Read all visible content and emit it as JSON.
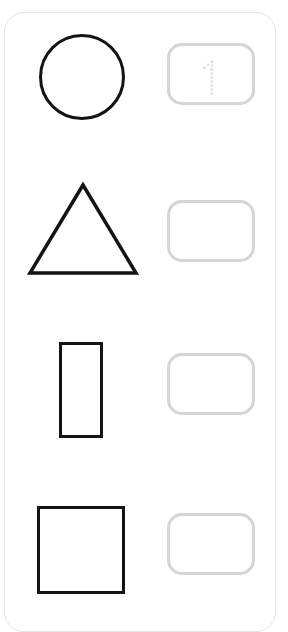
{
  "worksheet": {
    "card_name": "shape-counting-worksheet-card",
    "background_color": "#ffffff",
    "card_border_color": "#e2e2e2",
    "prompt_shape_color": "#141414",
    "answer_box_border_color": "#d5d5d5",
    "trace_hint_color": "#d9d9d9",
    "rows": [
      {
        "row_label": "row-circle",
        "shape": {
          "icon_name": "circle-outline-icon",
          "shape_type": "circle",
          "label": "Circle",
          "count": 1,
          "x": 38,
          "y": 33,
          "width": 86,
          "height": 86
        },
        "answer_box": {
          "name": "answer-box-circle",
          "x": 166,
          "y": 42,
          "width": 88,
          "height": 62,
          "value": "",
          "placeholder": "",
          "trace_hint": {
            "icon_name": "dotted-numeral-one-icon",
            "glyph": "1",
            "visible": true
          }
        }
      },
      {
        "row_label": "row-triangle",
        "shape": {
          "icon_name": "triangle-outline-icon",
          "shape_type": "triangle",
          "label": "Triangle",
          "count": 1,
          "x": 25,
          "y": 180,
          "width": 112,
          "height": 94
        },
        "answer_box": {
          "name": "answer-box-triangle",
          "x": 166,
          "y": 199,
          "width": 88,
          "height": 62,
          "value": "",
          "placeholder": "",
          "trace_hint": {
            "icon_name": "dotted-numeral-one-icon",
            "glyph": "",
            "visible": false
          }
        }
      },
      {
        "row_label": "row-rectangle",
        "shape": {
          "icon_name": "rectangle-outline-icon",
          "shape_type": "rectangle",
          "label": "Rectangle",
          "count": 1,
          "x": 58,
          "y": 341,
          "width": 44,
          "height": 96
        },
        "answer_box": {
          "name": "answer-box-rectangle",
          "x": 166,
          "y": 352,
          "width": 88,
          "height": 62,
          "value": "",
          "placeholder": "",
          "trace_hint": {
            "icon_name": "dotted-numeral-one-icon",
            "glyph": "",
            "visible": false
          }
        }
      },
      {
        "row_label": "row-square",
        "shape": {
          "icon_name": "square-outline-icon",
          "shape_type": "square",
          "label": "Square",
          "count": 1,
          "x": 36,
          "y": 505,
          "width": 88,
          "height": 88
        },
        "answer_box": {
          "name": "answer-box-square",
          "x": 166,
          "y": 512,
          "width": 88,
          "height": 62,
          "value": "",
          "placeholder": "",
          "trace_hint": {
            "icon_name": "dotted-numeral-one-icon",
            "glyph": "",
            "visible": false
          }
        }
      }
    ]
  }
}
